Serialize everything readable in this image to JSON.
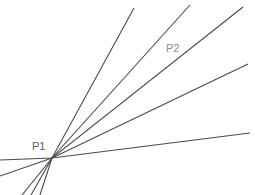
{
  "figure": {
    "background_color": "#ffffff",
    "width": 255,
    "height": 195
  },
  "chart_data": {
    "type": "scatter",
    "xlabel": "",
    "ylabel": "",
    "xlim": [
      0,
      255
    ],
    "ylim": [
      0,
      195
    ],
    "grid": false,
    "legend": null,
    "vertex": {
      "label": "P1",
      "x": 52,
      "y": 158
    },
    "series": [
      {
        "name": "ray-1",
        "x": [
          22,
          52,
          134
        ],
        "y": [
          195,
          158,
          8
        ],
        "stroke": "#4a4a4a",
        "stroke_width": 1.1
      },
      {
        "name": "ray-2",
        "x": [
          31,
          52,
          190
        ],
        "y": [
          195,
          158,
          5
        ],
        "stroke": "#4a4a4a",
        "stroke_width": 1.1
      },
      {
        "name": "ray-3",
        "x": [
          40,
          52,
          243
        ],
        "y": [
          195,
          158,
          7
        ],
        "stroke": "#4a4a4a",
        "stroke_width": 1.1
      },
      {
        "name": "ray-4",
        "x": [
          0,
          52,
          248
        ],
        "y": [
          176,
          158,
          64
        ],
        "stroke": "#4a4a4a",
        "stroke_width": 1.1
      },
      {
        "name": "ray-5",
        "x": [
          0,
          52,
          250
        ],
        "y": [
          160,
          158,
          133
        ],
        "stroke": "#4a4a4a",
        "stroke_width": 1.1
      }
    ],
    "annotations": [
      {
        "name": "label-p1",
        "text": "P1",
        "x": 32,
        "y": 150,
        "color": "#595959",
        "font_size": 11
      },
      {
        "name": "label-p2",
        "text": "P2",
        "x": 166,
        "y": 52,
        "color": "#8a8a8a",
        "font_size": 11
      }
    ]
  }
}
